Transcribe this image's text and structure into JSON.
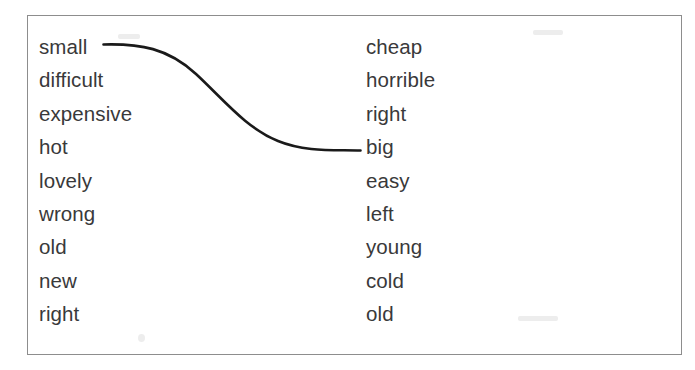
{
  "frame": {
    "border_color": "#8d8d8d",
    "background_color": "#ffffff"
  },
  "text_color": "#39393a",
  "connector": {
    "color": "#1a1a1a",
    "from_word": "small",
    "to_word": "big",
    "style": "hand-drawn-s-curve"
  },
  "exercise": {
    "left_column": {
      "name": "adjectives-column-left",
      "items": [
        {
          "label": "small"
        },
        {
          "label": "difficult"
        },
        {
          "label": "expensive"
        },
        {
          "label": "hot"
        },
        {
          "label": "lovely"
        },
        {
          "label": "wrong"
        },
        {
          "label": "old"
        },
        {
          "label": "new"
        },
        {
          "label": "right"
        }
      ]
    },
    "right_column": {
      "name": "adjectives-column-right",
      "items": [
        {
          "label": "cheap"
        },
        {
          "label": "horrible"
        },
        {
          "label": "right"
        },
        {
          "label": "big"
        },
        {
          "label": "easy"
        },
        {
          "label": "left"
        },
        {
          "label": "young"
        },
        {
          "label": "cold"
        },
        {
          "label": "old"
        }
      ]
    }
  }
}
